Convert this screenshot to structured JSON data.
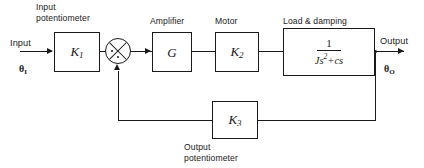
{
  "diagram": {
    "background_color": "#ffffff",
    "line_color": "#1a1a1a"
  },
  "signals": {
    "input_label": "Input",
    "input_symbol": "θ",
    "input_subscript": "I",
    "output_label": "Output",
    "output_symbol": "θ",
    "output_subscript": "O"
  },
  "captions": {
    "input_potentiometer": "Input\npotentiometer",
    "amplifier": "Amplifier",
    "motor": "Motor",
    "load_damping": "Load & damping",
    "output_potentiometer": "Output\npotentiometer"
  },
  "blocks": [
    {
      "id": "input-potentiometer",
      "gain_symbol": "K",
      "gain_subscript": "1",
      "caption": "Input potentiometer"
    },
    {
      "id": "amplifier",
      "gain_symbol": "G",
      "gain_subscript": "",
      "caption": "Amplifier"
    },
    {
      "id": "motor",
      "gain_symbol": "K",
      "gain_subscript": "2",
      "caption": "Motor"
    },
    {
      "id": "load-damping",
      "transfer_numerator": "1",
      "transfer_denominator_base": "Js",
      "transfer_denominator_exponent": "2",
      "transfer_denominator_tail": "+cs",
      "caption": "Load & damping"
    },
    {
      "id": "output-potentiometer",
      "gain_symbol": "K",
      "gain_subscript": "3",
      "caption": "Output potentiometer"
    }
  ],
  "summing_junction": {
    "name": "summing-junction",
    "style": "circle-with-cross"
  }
}
